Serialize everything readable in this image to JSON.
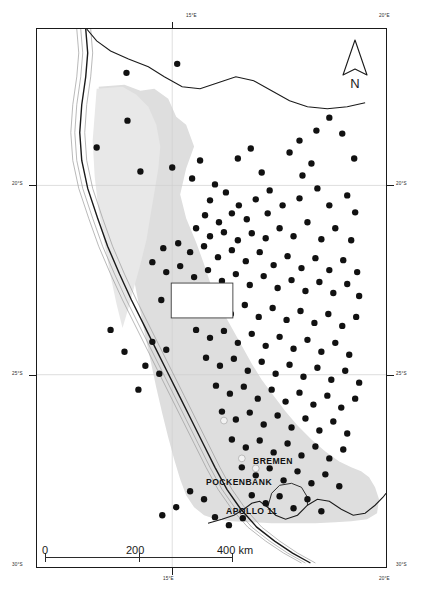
{
  "figure": {
    "kind": "locality-map",
    "region_name": "Namibia",
    "background_color": "#ffffff",
    "frame_color": "#1a1a1a",
    "land_shade_color": "#dddddd",
    "point_color": "#111111",
    "site_marker_color": "#f2f2f2"
  },
  "graticule": {
    "longitude_labels": [
      {
        "text": "15°E",
        "position": "top"
      },
      {
        "text": "20°E",
        "position": "top-right"
      },
      {
        "text": "15°E",
        "position": "bottom"
      },
      {
        "text": "20°E",
        "position": "bottom-right"
      }
    ],
    "latitude_labels": [
      {
        "text": "20°S",
        "position": "left"
      },
      {
        "text": "20°S",
        "position": "right"
      },
      {
        "text": "25°S",
        "position": "left"
      },
      {
        "text": "25°S",
        "position": "right"
      },
      {
        "text": "30°S",
        "position": "bottom-left"
      },
      {
        "text": "30°S",
        "position": "bottom-right"
      }
    ]
  },
  "scale_bar": {
    "ticks": [
      "0",
      "200",
      "400"
    ],
    "unit": "km",
    "label_400": "400 km"
  },
  "north_arrow": {
    "letter": "N",
    "name": "north-arrow"
  },
  "sites": [
    {
      "label": "BREMEN",
      "x": 252,
      "y": 432
    },
    {
      "label": "POCKENBANK",
      "x": 205,
      "y": 453
    },
    {
      "label": "APOLLO 11",
      "x": 225,
      "y": 482
    }
  ],
  "site_markers": [
    {
      "name": "bremen-marker",
      "cx": 224,
      "cy": 421
    },
    {
      "name": "pockenbank-marker",
      "cx": 242,
      "cy": 459
    },
    {
      "name": "apollo11-marker",
      "cx": 256,
      "cy": 469
    }
  ],
  "chart_data": {
    "type": "scatter",
    "title": "",
    "xlabel": "Longitude",
    "ylabel": "Latitude",
    "xlim": [
      11.0,
      20.0
    ],
    "ylim": [
      -30.0,
      -17.0
    ],
    "grid": true,
    "legend": "none",
    "note": "Black filled circles mark archaeological / sample localities; light circles mark the three named sites.",
    "named_points": [
      {
        "name": "BREMEN",
        "lon": 16.55,
        "lat": -27.35
      },
      {
        "name": "POCKENBANK",
        "lon": 16.95,
        "lat": -27.95
      },
      {
        "name": "APOLLO 11",
        "lon": 17.3,
        "lat": -28.1
      }
    ],
    "points": [
      [
        126,
        72
      ],
      [
        177,
        63
      ],
      [
        127,
        120
      ],
      [
        200,
        160
      ],
      [
        172,
        167
      ],
      [
        300,
        140
      ],
      [
        290,
        152
      ],
      [
        312,
        163
      ],
      [
        303,
        175
      ],
      [
        317,
        130
      ],
      [
        343,
        133
      ],
      [
        330,
        117
      ],
      [
        355,
        158
      ],
      [
        96,
        147
      ],
      [
        140,
        171
      ],
      [
        192,
        178
      ],
      [
        238,
        158
      ],
      [
        251,
        148
      ],
      [
        262,
        172
      ],
      [
        215,
        184
      ],
      [
        226,
        192
      ],
      [
        210,
        200
      ],
      [
        239,
        205
      ],
      [
        256,
        199
      ],
      [
        270,
        190
      ],
      [
        283,
        205
      ],
      [
        300,
        198
      ],
      [
        318,
        188
      ],
      [
        330,
        205
      ],
      [
        348,
        195
      ],
      [
        356,
        212
      ],
      [
        268,
        213
      ],
      [
        247,
        219
      ],
      [
        232,
        213
      ],
      [
        219,
        222
      ],
      [
        205,
        215
      ],
      [
        196,
        228
      ],
      [
        210,
        236
      ],
      [
        224,
        232
      ],
      [
        238,
        240
      ],
      [
        252,
        233
      ],
      [
        266,
        238
      ],
      [
        280,
        228
      ],
      [
        294,
        236
      ],
      [
        308,
        222
      ],
      [
        322,
        239
      ],
      [
        336,
        228
      ],
      [
        352,
        240
      ],
      [
        163,
        248
      ],
      [
        178,
        243
      ],
      [
        190,
        252
      ],
      [
        204,
        246
      ],
      [
        218,
        257
      ],
      [
        232,
        250
      ],
      [
        246,
        261
      ],
      [
        260,
        252
      ],
      [
        274,
        265
      ],
      [
        288,
        256
      ],
      [
        302,
        268
      ],
      [
        316,
        258
      ],
      [
        330,
        270
      ],
      [
        344,
        260
      ],
      [
        358,
        272
      ],
      [
        152,
        262
      ],
      [
        166,
        272
      ],
      [
        180,
        266
      ],
      [
        194,
        277
      ],
      [
        208,
        270
      ],
      [
        222,
        281
      ],
      [
        236,
        274
      ],
      [
        250,
        285
      ],
      [
        264,
        276
      ],
      [
        278,
        288
      ],
      [
        292,
        280
      ],
      [
        306,
        291
      ],
      [
        320,
        282
      ],
      [
        334,
        293
      ],
      [
        348,
        284
      ],
      [
        360,
        296
      ],
      [
        161,
        300
      ],
      [
        175,
        306
      ],
      [
        189,
        298
      ],
      [
        203,
        310
      ],
      [
        217,
        302
      ],
      [
        231,
        314
      ],
      [
        245,
        305
      ],
      [
        259,
        317
      ],
      [
        273,
        308
      ],
      [
        287,
        320
      ],
      [
        301,
        311
      ],
      [
        315,
        323
      ],
      [
        329,
        314
      ],
      [
        343,
        326
      ],
      [
        357,
        317
      ],
      [
        196,
        330
      ],
      [
        210,
        338
      ],
      [
        224,
        331
      ],
      [
        238,
        343
      ],
      [
        252,
        334
      ],
      [
        266,
        346
      ],
      [
        280,
        337
      ],
      [
        294,
        349
      ],
      [
        308,
        340
      ],
      [
        322,
        352
      ],
      [
        336,
        343
      ],
      [
        350,
        355
      ],
      [
        206,
        358
      ],
      [
        220,
        366
      ],
      [
        234,
        359
      ],
      [
        248,
        371
      ],
      [
        262,
        362
      ],
      [
        276,
        374
      ],
      [
        290,
        365
      ],
      [
        304,
        377
      ],
      [
        318,
        368
      ],
      [
        332,
        380
      ],
      [
        346,
        371
      ],
      [
        360,
        383
      ],
      [
        216,
        386
      ],
      [
        230,
        394
      ],
      [
        244,
        387
      ],
      [
        258,
        399
      ],
      [
        272,
        390
      ],
      [
        286,
        402
      ],
      [
        300,
        393
      ],
      [
        314,
        405
      ],
      [
        328,
        396
      ],
      [
        342,
        408
      ],
      [
        356,
        399
      ],
      [
        222,
        412
      ],
      [
        236,
        420
      ],
      [
        250,
        413
      ],
      [
        264,
        425
      ],
      [
        278,
        416
      ],
      [
        292,
        428
      ],
      [
        306,
        419
      ],
      [
        320,
        431
      ],
      [
        334,
        422
      ],
      [
        348,
        434
      ],
      [
        232,
        440
      ],
      [
        246,
        448
      ],
      [
        260,
        441
      ],
      [
        274,
        453
      ],
      [
        288,
        444
      ],
      [
        302,
        456
      ],
      [
        316,
        447
      ],
      [
        330,
        459
      ],
      [
        344,
        450
      ],
      [
        242,
        468
      ],
      [
        256,
        476
      ],
      [
        270,
        469
      ],
      [
        284,
        481
      ],
      [
        298,
        472
      ],
      [
        312,
        484
      ],
      [
        326,
        475
      ],
      [
        340,
        487
      ],
      [
        252,
        496
      ],
      [
        266,
        504
      ],
      [
        280,
        497
      ],
      [
        294,
        509
      ],
      [
        308,
        500
      ],
      [
        322,
        512
      ],
      [
        190,
        492
      ],
      [
        204,
        500
      ],
      [
        176,
        508
      ],
      [
        162,
        516
      ],
      [
        215,
        518
      ],
      [
        229,
        526
      ],
      [
        243,
        519
      ],
      [
        152,
        342
      ],
      [
        166,
        350
      ],
      [
        145,
        366
      ],
      [
        159,
        374
      ],
      [
        138,
        390
      ],
      [
        124,
        352
      ],
      [
        110,
        330
      ]
    ]
  }
}
